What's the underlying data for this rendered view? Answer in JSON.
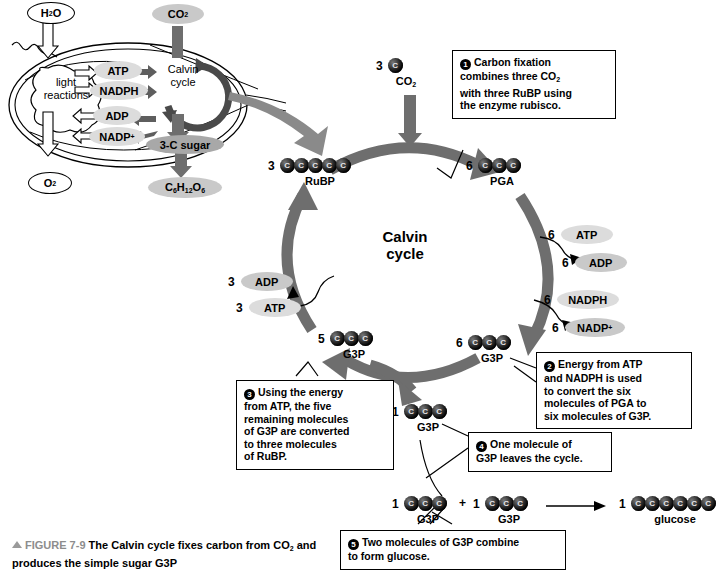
{
  "figure": {
    "number": "FIGURE 7-9",
    "caption_line1": "The Calvin cycle fixes carbon from CO",
    "caption_sub1": "2",
    "caption_line1b": " and",
    "caption_line2": "produces the simple sugar G3P"
  },
  "chloroplast": {
    "input_water": "H",
    "input_water_sub": "2",
    "input_water_b": "O",
    "input_co2": "CO",
    "input_co2_sub": "2",
    "output_o2": "O",
    "output_o2_sub": "2",
    "light_reactions_line1": "light",
    "light_reactions_line2": "reactions",
    "calvin_line1": "Calvin",
    "calvin_line2": "cycle",
    "atp": "ATP",
    "nadph": "NADPH",
    "adp": "ADP",
    "nadp": "NADP",
    "nadp_sup": "+",
    "three_c_sugar": "3-C sugar",
    "glucose_formula_c": "C",
    "glucose_formula_6a": "6",
    "glucose_formula_h": "H",
    "glucose_formula_12": "12",
    "glucose_formula_o": "O",
    "glucose_formula_6b": "6"
  },
  "cycle": {
    "center_line1": "Calvin",
    "center_line2": "cycle"
  },
  "molecules": {
    "co2_in": {
      "count": "3",
      "carbons": 1,
      "label": "CO",
      "label_sub": "2"
    },
    "rubp": {
      "count": "3",
      "carbons": 5,
      "label": "RuBP"
    },
    "pga": {
      "count": "6",
      "carbons": 3,
      "label": "PGA"
    },
    "g3p_right": {
      "count": "6",
      "carbons": 3,
      "label": "G3P"
    },
    "g3p_left": {
      "count": "5",
      "carbons": 3,
      "label": "G3P"
    },
    "g3p_exit": {
      "count": "1",
      "carbons": 3,
      "label": "G3P"
    },
    "g3p_sum_a": {
      "count": "1",
      "carbons": 3,
      "label": "G3P"
    },
    "g3p_sum_b": {
      "count": "1",
      "carbons": 3,
      "label": "G3P"
    },
    "glucose": {
      "count": "1",
      "carbons": 6,
      "label": "glucose"
    },
    "plus_sign": "+"
  },
  "cofactors": {
    "atp_right": {
      "count": "6",
      "name": "ATP"
    },
    "adp_right": {
      "count": "6",
      "name": "ADP"
    },
    "nadph_right": {
      "count": "6",
      "name": "NADPH"
    },
    "nadp_right": {
      "count": "6",
      "name": "NADP",
      "sup": "+"
    },
    "adp_left": {
      "count": "3",
      "name": "ADP"
    },
    "atp_left": {
      "count": "3",
      "name": "ATP"
    }
  },
  "callouts": [
    {
      "num": "1",
      "text": "Carbon fixation combines three CO₂ with three RuBP using the enzyme rubisco.",
      "lines": [
        "Carbon fixation",
        "combines three CO",
        "with three RuBP using",
        "the enzyme rubisco."
      ]
    },
    {
      "num": "2",
      "text": "Energy from ATP and NADPH is used to convert the six molecules of PGA to six molecules of G3P.",
      "lines": [
        "Energy from ATP",
        "and NADPH is used",
        "to convert the six",
        "molecules of PGA to",
        "six molecules of G3P."
      ]
    },
    {
      "num": "3",
      "text": "Using the energy from ATP, the five remaining molecules of G3P are converted to three molecules of RuBP.",
      "lines": [
        "Using the energy",
        "from ATP, the five",
        "remaining molecules",
        "of G3P are converted",
        "to three molecules",
        "of RuBP."
      ]
    },
    {
      "num": "4",
      "text": "One molecule of G3P leaves the cycle.",
      "lines": [
        "One molecule of",
        "G3P leaves the cycle."
      ]
    },
    {
      "num": "5",
      "text": "Two molecules of G3P combine to form glucose.",
      "lines": [
        "Two molecules of G3P combine",
        "to form glucose."
      ]
    }
  ],
  "colors": {
    "arrow_grey": "#6e6e6e",
    "ring_grey": "#5a5a5a",
    "pill_grey": "#c9c9c9",
    "fignum_grey": "#8d8d8d"
  }
}
